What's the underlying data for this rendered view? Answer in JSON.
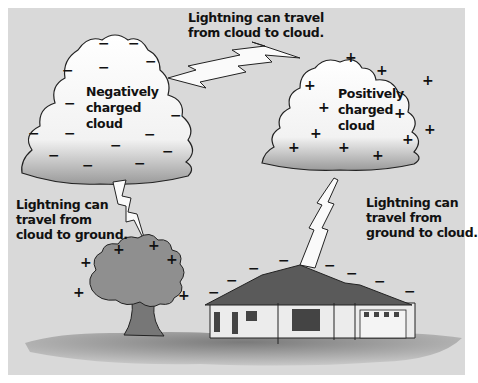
{
  "labels": {
    "cloud_to_cloud": "Lightning can travel\nfrom cloud to cloud.",
    "negative_cloud": "Negatively\ncharged\ncloud",
    "positive_cloud": "Positively\ncharged\ncloud",
    "cloud_to_ground": "Lightning can\ntravel from\ncloud to ground.",
    "ground_to_cloud": "Lightning can\ntravel from\nground to cloud."
  },
  "symbols": {
    "negative": "−",
    "positive": "+"
  },
  "colors": {
    "background": "#d9d9d9",
    "cloud": "#f7f7f7",
    "cloud_shadow": "#9a9a9a",
    "tree": "#8f8f8f",
    "roof": "#5a5a5a",
    "house_wall": "#ececec",
    "ground": "#8a8a8a"
  }
}
